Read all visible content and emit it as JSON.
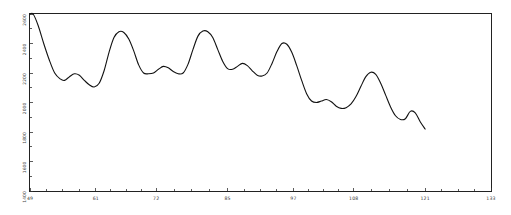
{
  "chart_data": {
    "type": "line",
    "title": "",
    "subtitle": "",
    "xlabel": "",
    "ylabel": "",
    "xlim": [
      49,
      133
    ],
    "ylim": [
      1400,
      2600
    ],
    "grid": false,
    "legend": null,
    "xticks": [
      "49",
      "61",
      "72",
      "85",
      "97",
      "108",
      "121",
      "133"
    ],
    "xtick_values": [
      49,
      61,
      72,
      85,
      97,
      108,
      121,
      133
    ],
    "yticks": [
      "2600",
      "2400",
      "2200",
      "2000",
      "1800",
      "1600",
      "1400"
    ],
    "ytick_values": [
      2600,
      2400,
      2200,
      2000,
      1800,
      1600,
      1400
    ],
    "series": [
      {
        "name": "series-1",
        "x": [
          49.0,
          49.6,
          50.5,
          51.5,
          52.5,
          53.5,
          54.5,
          55.3,
          56.2,
          57.1,
          58.0,
          58.9,
          59.8,
          60.7,
          61.6,
          62.5,
          63.4,
          64.3,
          65.2,
          66.1,
          67.0,
          67.9,
          68.8,
          69.7,
          70.6,
          71.5,
          72.4,
          73.3,
          74.2,
          75.1,
          76.0,
          76.9,
          77.8,
          78.7,
          79.6,
          80.5,
          81.4,
          82.3,
          83.2,
          84.1,
          85.0,
          85.9,
          86.8,
          87.7,
          88.6,
          89.5,
          90.4,
          91.3,
          92.2,
          93.1,
          94.0,
          94.9,
          95.8,
          96.7,
          97.6,
          98.5,
          99.4,
          100.3,
          101.2,
          102.1,
          103.0,
          103.9,
          104.8,
          105.7,
          106.6,
          107.5,
          108.4,
          109.3,
          110.2,
          111.1,
          112.0,
          112.9,
          113.8,
          114.7,
          115.6,
          116.5,
          117.4,
          118.3,
          119.2,
          120.1,
          121.0
        ],
        "values": [
          2600,
          2598,
          2520,
          2400,
          2290,
          2200,
          2160,
          2150,
          2175,
          2195,
          2185,
          2150,
          2120,
          2105,
          2130,
          2215,
          2340,
          2440,
          2480,
          2475,
          2430,
          2350,
          2255,
          2200,
          2195,
          2200,
          2225,
          2245,
          2235,
          2210,
          2195,
          2200,
          2260,
          2360,
          2450,
          2485,
          2480,
          2440,
          2360,
          2280,
          2230,
          2225,
          2245,
          2265,
          2250,
          2215,
          2185,
          2180,
          2200,
          2265,
          2345,
          2400,
          2395,
          2340,
          2250,
          2150,
          2060,
          2010,
          2000,
          2010,
          2020,
          2005,
          1975,
          1960,
          1965,
          1990,
          2040,
          2110,
          2175,
          2205,
          2190,
          2130,
          2050,
          1970,
          1910,
          1885,
          1890,
          1940,
          1930,
          1870,
          1820
        ]
      }
    ]
  },
  "axes": {
    "frame_visible": true,
    "x_axis_name": "x-axis",
    "y_axis_name": "y-axis"
  }
}
